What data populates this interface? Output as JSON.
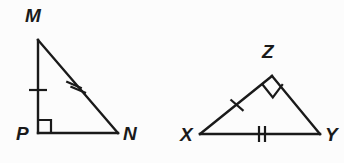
{
  "figure": {
    "background_color": "#fcfcfc",
    "stroke_color": "#1a1a1a",
    "triangles": [
      {
        "name": "triangle-MPN",
        "vertices": [
          {
            "label": "M",
            "x": 38,
            "y": 40,
            "label_x": 25,
            "label_y": 6
          },
          {
            "label": "P",
            "x": 38,
            "y": 133,
            "label_x": 16,
            "label_y": 124
          },
          {
            "label": "N",
            "x": 118,
            "y": 133,
            "label_x": 123,
            "label_y": 124
          }
        ],
        "right_angle": {
          "at": "P",
          "style": "square",
          "size": 13
        },
        "tick_marks": [
          {
            "side": "MP",
            "count": 1,
            "cx": 38,
            "cy": 90
          },
          {
            "side": "MN",
            "count": 2,
            "cx": 77,
            "cy": 87
          }
        ]
      },
      {
        "name": "triangle-XZY",
        "vertices": [
          {
            "label": "Z",
            "x": 272,
            "y": 76,
            "label_x": 262,
            "label_y": 42
          },
          {
            "label": "X",
            "x": 200,
            "y": 134,
            "label_x": 180,
            "label_y": 125
          },
          {
            "label": "Y",
            "x": 320,
            "y": 134,
            "label_x": 325,
            "label_y": 125
          }
        ],
        "right_angle": {
          "at": "Z",
          "style": "diamond",
          "size": 13
        },
        "tick_marks": [
          {
            "side": "XZ",
            "count": 1,
            "cx": 237,
            "cy": 105
          },
          {
            "side": "XY",
            "count": 2,
            "cx": 262,
            "cy": 134
          }
        ]
      }
    ],
    "labels": {
      "M": "M",
      "P": "P",
      "N": "N",
      "Z": "Z",
      "X": "X",
      "Y": "Y"
    }
  }
}
